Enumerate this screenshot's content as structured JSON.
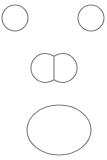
{
  "figure": {
    "background": "#ffffff",
    "stroke_color": "#7a7a7a",
    "stroke_width": 1.1,
    "shapes": [
      {
        "name": "left-eye",
        "type": "circle",
        "cx": 15,
        "cy": 18,
        "r": 13
      },
      {
        "name": "right-eye",
        "type": "circle",
        "cx": 91,
        "cy": 18,
        "r": 13
      },
      {
        "name": "nose-left-lobe",
        "type": "circle",
        "cx": 41,
        "cy": 68,
        "r": 14.5
      },
      {
        "name": "nose-right-lobe",
        "type": "circle",
        "cx": 67,
        "cy": 68,
        "r": 14.5
      },
      {
        "name": "mouth",
        "type": "ellipse",
        "cx": 59,
        "cy": 130,
        "rx": 32,
        "ry": 25
      }
    ]
  }
}
